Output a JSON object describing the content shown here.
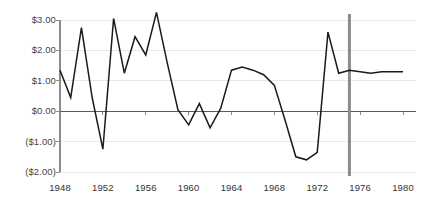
{
  "chart_data": {
    "type": "line",
    "title": "",
    "subtitle": "",
    "xlabel": "",
    "ylabel": "",
    "x": [
      1948,
      1949,
      1950,
      1951,
      1952,
      1953,
      1954,
      1955,
      1956,
      1957,
      1958,
      1959,
      1960,
      1961,
      1962,
      1963,
      1964,
      1965,
      1966,
      1967,
      1968,
      1969,
      1970,
      1971,
      1972,
      1973,
      1974,
      1975,
      1976,
      1977,
      1978,
      1979,
      1980
    ],
    "values": [
      1.35,
      0.45,
      2.75,
      0.45,
      -1.25,
      3.05,
      1.25,
      2.45,
      1.85,
      3.25,
      1.6,
      0.05,
      -0.45,
      0.25,
      -0.55,
      0.1,
      1.35,
      1.45,
      1.35,
      1.2,
      0.85,
      -0.3,
      -1.5,
      -1.6,
      -1.35,
      2.6,
      1.25,
      1.35,
      1.3,
      1.25,
      1.3,
      1.3,
      1.3
    ],
    "series": [
      {
        "name": "value",
        "color": "#1a1a1a",
        "values": [
          1.35,
          0.45,
          2.75,
          0.45,
          -1.25,
          3.05,
          1.25,
          2.45,
          1.85,
          3.25,
          1.6,
          0.05,
          -0.45,
          0.25,
          -0.55,
          0.1,
          1.35,
          1.45,
          1.35,
          1.2,
          0.85,
          -0.3,
          -1.5,
          -1.6,
          -1.35,
          2.6,
          1.25,
          1.35,
          1.3,
          1.25,
          1.3,
          1.3,
          1.3
        ]
      }
    ],
    "xlim": [
      1948,
      1980
    ],
    "ylim": [
      -2.0,
      3.0
    ],
    "y_ticks": [
      3.0,
      2.0,
      1.0,
      0.0,
      -1.0,
      -2.0
    ],
    "y_tick_labels": [
      "$3.00",
      "$2.00",
      "$1.00",
      "$0.00",
      "($1.00)",
      "($2.00)"
    ],
    "x_ticks": [
      1948,
      1952,
      1956,
      1960,
      1964,
      1968,
      1972,
      1976,
      1980
    ],
    "x_tick_labels": [
      "1948",
      "1952",
      "1956",
      "1960",
      "1964",
      "1968",
      "1972",
      "1976",
      "1980"
    ],
    "grid": true,
    "grid_axis": "y",
    "legend": false,
    "legend_position": "none",
    "annotations": [
      {
        "name": "vertical-marker-line",
        "type": "vline",
        "x": 1975.0,
        "color": "#8c8c8c",
        "width": 3
      }
    ],
    "zero_line": {
      "value": 0.0,
      "color": "#595959"
    }
  },
  "colors": {
    "line": "#1a1a1a",
    "grid": "#e8e8e8",
    "axis": "#8c8c8c",
    "zero_line": "#595959",
    "marker": "#8c8c8c",
    "y_label_text": "#444444",
    "x_label_text": "#333333",
    "background": "#ffffff"
  }
}
